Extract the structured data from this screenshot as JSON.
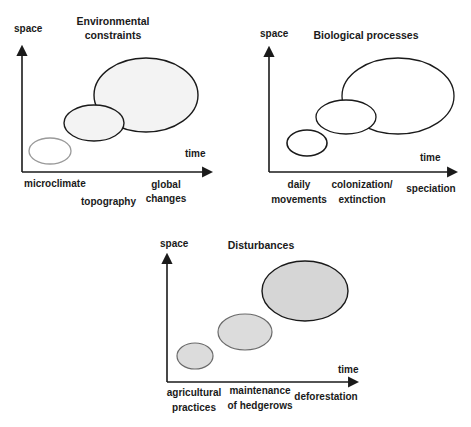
{
  "colors": {
    "ink": "#1a1a1a",
    "light_stroke": "#9a9a9a",
    "fill_light": "#f3f3f3",
    "fill_gray": "#d6d6d6"
  },
  "panels": [
    {
      "title_lines": [
        "Environmental",
        "constraints"
      ],
      "y_axis_label": "space",
      "x_axis_label": "time",
      "scales": [
        {
          "lines": [
            "microclimate"
          ]
        },
        {
          "lines": [
            "topography"
          ]
        },
        {
          "lines": [
            "global",
            "changes"
          ]
        }
      ]
    },
    {
      "title_lines": [
        "Biological processes"
      ],
      "y_axis_label": "space",
      "x_axis_label": "time",
      "scales": [
        {
          "lines": [
            "daily",
            "movements"
          ]
        },
        {
          "lines": [
            "colonization/",
            "extinction"
          ]
        },
        {
          "lines": [
            "speciation"
          ]
        }
      ]
    },
    {
      "title_lines": [
        "Disturbances"
      ],
      "y_axis_label": "space",
      "x_axis_label": "time",
      "scales": [
        {
          "lines": [
            "agricultural",
            "practices"
          ]
        },
        {
          "lines": [
            "maintenance",
            "of hedgerows"
          ]
        },
        {
          "lines": [
            "deforestation"
          ]
        }
      ]
    }
  ]
}
